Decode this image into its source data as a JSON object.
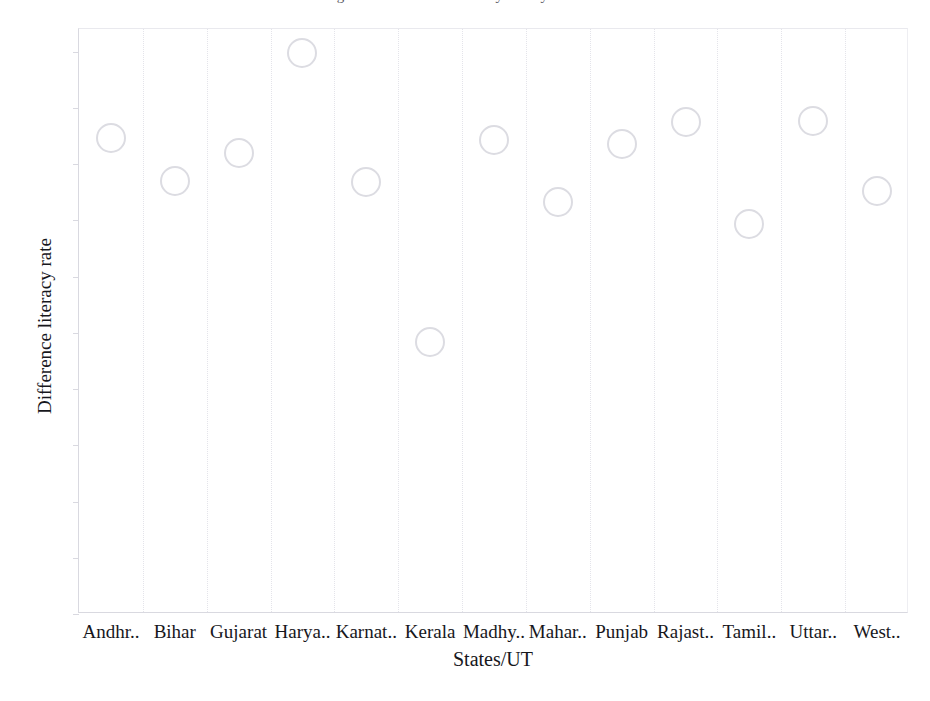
{
  "figure": {
    "title_clipped": "Figure : Difference in literacy rate by State/UT",
    "background_color": "#ffffff",
    "marker_color": "#dcdce2",
    "text_color": "#17171c"
  },
  "chart_data": {
    "type": "scatter",
    "title": "Figure : Difference in literacy rate by State/UT",
    "xlabel": "States/UT",
    "ylabel": "Difference literacy rate",
    "categories": [
      "Andhr..",
      "Bihar",
      "Gujarat",
      "Harya..",
      "Karnat..",
      "Kerala",
      "Madhy..",
      "Mahar..",
      "Punjab",
      "Rajast..",
      "Tamil..",
      "Uttar..",
      "West.."
    ],
    "values": [
      42.3,
      38.5,
      41.0,
      49.9,
      38.4,
      24.2,
      42.1,
      36.6,
      41.8,
      43.7,
      34.7,
      43.8,
      37.6
    ],
    "ylim": [
      0,
      52
    ],
    "yticks": [
      0,
      5,
      10,
      15,
      20,
      25,
      30,
      35,
      40,
      45,
      50
    ],
    "ytick_labels": [
      "0",
      "5",
      "10",
      "15",
      "20",
      "25",
      "30",
      "35",
      "40",
      "45",
      "50"
    ],
    "grid": "vertical-panel-dividers",
    "legend": "none",
    "marker": "open-circle"
  }
}
